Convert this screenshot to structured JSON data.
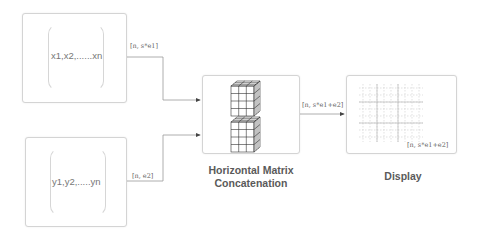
{
  "inputs": [
    {
      "id": "x",
      "vector_text": "x1,x2,......xn",
      "shape_label": "[n, s*e1]"
    },
    {
      "id": "y",
      "vector_text": "y1,y2,.....yn",
      "shape_label": "[n, e2]"
    }
  ],
  "concat": {
    "caption_line1": "Horizontal Matrix",
    "caption_line2": "Concatenation",
    "output_label": "[n, s*e1+e2]",
    "icon": "stacked-cube-grid-icon"
  },
  "display": {
    "caption": "Display",
    "shape_label": "[n, s*e1+e2]",
    "icon": "grid-icon"
  },
  "colors": {
    "line": "#8a8a8a",
    "box_border": "#d4d4d4",
    "text": "#5a5a5a"
  }
}
